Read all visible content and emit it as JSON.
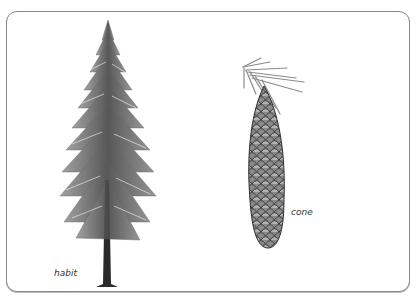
{
  "figure": {
    "panels": [
      {
        "id": "habit",
        "label": "habit",
        "subject": "conifer-tree-illustration"
      },
      {
        "id": "cone",
        "label": "cone",
        "subject": "conifer-cone-with-needles-illustration"
      }
    ],
    "colors": {
      "frame_border": "#8a8a8a",
      "background": "#ffffff",
      "ink": "#333333"
    }
  }
}
